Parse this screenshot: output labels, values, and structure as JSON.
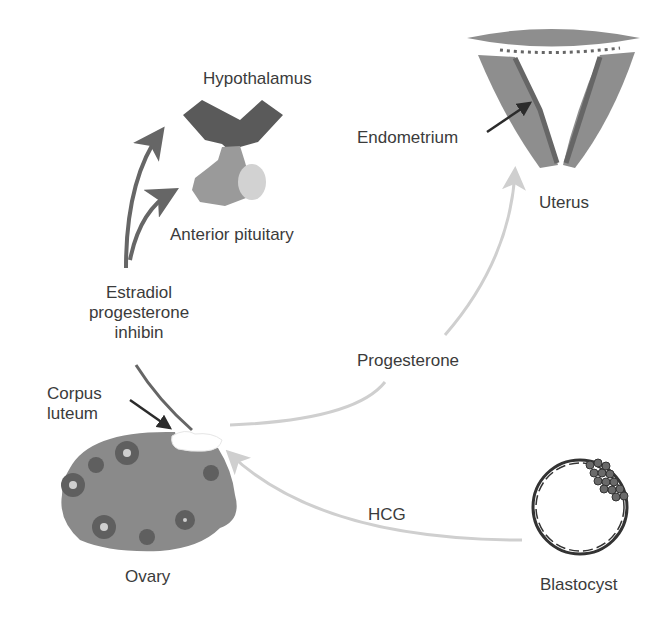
{
  "labels": {
    "hypothalamus": "Hypothalamus",
    "anterior_pituitary": "Anterior pituitary",
    "endometrium": "Endometrium",
    "uterus": "Uterus",
    "hormones_feedback": [
      "Estradiol",
      "progesterone",
      "inhibin"
    ],
    "progesterone": "Progesterone",
    "corpus_luteum": [
      "Corpus",
      "luteum"
    ],
    "hcg": "HCG",
    "ovary": "Ovary",
    "blastocyst": "Blastocyst"
  },
  "colors": {
    "hypothalamus": "#5a5a5a",
    "pituitary": "#9a9a9a",
    "pituitary_light": "#d2d2d2",
    "uterus": "#8e8e8e",
    "endometrium": "#666666",
    "ovary": "#8a8a8a",
    "follicle": "#5f5f5f",
    "feedback_arrow": "#666666",
    "progesterone_arrow": "#cfcfcf",
    "hcg_arrow": "#cfcfcf",
    "pointer_arrow": "#2b2b2b"
  }
}
